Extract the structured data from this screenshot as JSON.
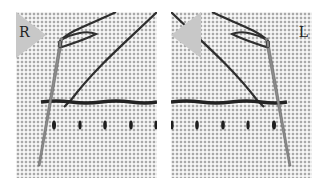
{
  "figure": {
    "panels": [
      {
        "label": "R",
        "side": "left",
        "description": "Right-handed running/backstitch demonstration on Aida cloth"
      },
      {
        "label": "L",
        "side": "right",
        "description": "Left-handed running/backstitch demonstration on Aida cloth"
      }
    ],
    "colors": {
      "fabric": "#e9e9e9",
      "fabric_hole": "#a9a9a9",
      "thread": "#2a2a2a",
      "needle": "#8a8a8a",
      "badge": "#c8c8c8"
    }
  }
}
